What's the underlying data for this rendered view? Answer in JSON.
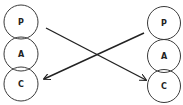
{
  "diagram": {
    "left": {
      "states": [
        {
          "label": "P",
          "cx": 21,
          "cy": 22
        },
        {
          "label": "A",
          "cx": 21,
          "cy": 54
        },
        {
          "label": "C",
          "cx": 21,
          "cy": 84
        }
      ],
      "r": 17
    },
    "right": {
      "states": [
        {
          "label": "P",
          "cx": 164,
          "cy": 23
        },
        {
          "label": "A",
          "cx": 164,
          "cy": 56
        },
        {
          "label": "C",
          "cx": 164,
          "cy": 86
        }
      ],
      "r": 16.5
    },
    "arrows": [
      {
        "from": "left-P",
        "to": "right-C",
        "x1": 46,
        "y1": 28,
        "x2": 146,
        "y2": 80
      },
      {
        "from": "right-P",
        "to": "left-C",
        "x1": 144,
        "y1": 33,
        "x2": 44,
        "y2": 79
      }
    ],
    "colors": {
      "stroke": "#222222",
      "background": "#ffffff"
    }
  }
}
